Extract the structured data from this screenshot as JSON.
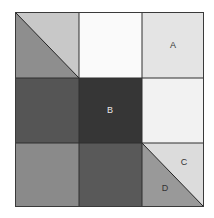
{
  "diagram": {
    "type": "3x3 grayscale quilt-block grid",
    "cells": [
      {
        "row": 0,
        "col": 0,
        "kind": "diagonal",
        "upper_color": "#c8c8c8",
        "lower_color": "#8e8e8e"
      },
      {
        "row": 0,
        "col": 1,
        "color": "#fafafa"
      },
      {
        "row": 0,
        "col": 2,
        "color": "#e4e4e4",
        "label": "A"
      },
      {
        "row": 1,
        "col": 0,
        "color": "#555555"
      },
      {
        "row": 1,
        "col": 1,
        "color": "#363636",
        "label": "B"
      },
      {
        "row": 1,
        "col": 2,
        "color": "#f2f2f2"
      },
      {
        "row": 2,
        "col": 0,
        "color": "#8a8a8a"
      },
      {
        "row": 2,
        "col": 1,
        "color": "#595959"
      },
      {
        "row": 2,
        "col": 2,
        "kind": "diagonal",
        "upper_color": "#dcdcdc",
        "lower_color": "#999999",
        "labels": [
          "C",
          "D"
        ]
      }
    ],
    "labels": {
      "a": "A",
      "b": "B",
      "c": "C",
      "d": "D"
    }
  }
}
